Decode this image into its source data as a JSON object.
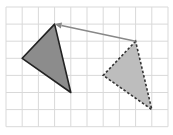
{
  "figure": {
    "type": "translation-diagram",
    "grid": {
      "origin_px": [
        6,
        7
      ],
      "cell_w": 16.2,
      "cell_h": 17.1,
      "cols": 10,
      "rows": 7,
      "line_color": "#d9d9d9",
      "border_color": "#d0d0d0"
    },
    "original_triangle": {
      "vertices_grid": [
        [
          3,
          1
        ],
        [
          1,
          3
        ],
        [
          4,
          5
        ]
      ],
      "fill": "#8c8c8c",
      "stroke": "#222222",
      "style": "solid"
    },
    "image_triangle": {
      "vertices_grid": [
        [
          8,
          2
        ],
        [
          6,
          4
        ],
        [
          9,
          6
        ]
      ],
      "fill": "#bdbdbd",
      "stroke": "#333333",
      "style": "dashed"
    },
    "arrow": {
      "from_grid": [
        8,
        2
      ],
      "to_grid": [
        3,
        1
      ],
      "color": "#888888"
    }
  }
}
